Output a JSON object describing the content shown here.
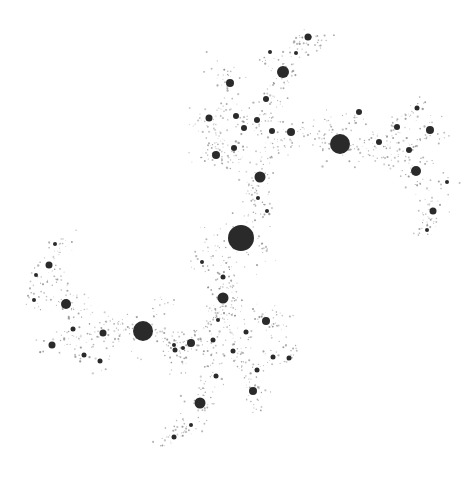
{
  "image": {
    "title": "Julia set fractal (dendrite of discs)",
    "width": 476,
    "height": 481,
    "background": "#ffffff",
    "ink": "#2a2a2a",
    "dust": "#8a8a8a"
  },
  "discs": [
    {
      "x": 241,
      "y": 238,
      "r": 13
    },
    {
      "x": 340,
      "y": 144,
      "r": 10
    },
    {
      "x": 143,
      "y": 331,
      "r": 10
    },
    {
      "x": 283,
      "y": 72,
      "r": 6
    },
    {
      "x": 260,
      "y": 177,
      "r": 5.5
    },
    {
      "x": 223,
      "y": 298,
      "r": 5.5
    },
    {
      "x": 200,
      "y": 403,
      "r": 5.5
    },
    {
      "x": 416,
      "y": 171,
      "r": 5
    },
    {
      "x": 66,
      "y": 304,
      "r": 5
    },
    {
      "x": 230,
      "y": 83,
      "r": 4
    },
    {
      "x": 216,
      "y": 155,
      "r": 4
    },
    {
      "x": 291,
      "y": 132,
      "r": 4
    },
    {
      "x": 191,
      "y": 343,
      "r": 4
    },
    {
      "x": 266,
      "y": 321,
      "r": 4
    },
    {
      "x": 253,
      "y": 391,
      "r": 4
    },
    {
      "x": 430,
      "y": 130,
      "r": 4
    },
    {
      "x": 433,
      "y": 211,
      "r": 3.5
    },
    {
      "x": 49,
      "y": 265,
      "r": 3.5
    },
    {
      "x": 52,
      "y": 345,
      "r": 3.5
    },
    {
      "x": 103,
      "y": 333,
      "r": 3.5
    },
    {
      "x": 308,
      "y": 37,
      "r": 3.5
    },
    {
      "x": 209,
      "y": 118,
      "r": 3.5
    },
    {
      "x": 257,
      "y": 120,
      "r": 3
    },
    {
      "x": 266,
      "y": 99,
      "r": 3
    },
    {
      "x": 236,
      "y": 116,
      "r": 3
    },
    {
      "x": 272,
      "y": 131,
      "r": 3
    },
    {
      "x": 234,
      "y": 148,
      "r": 3
    },
    {
      "x": 244,
      "y": 128,
      "r": 3
    },
    {
      "x": 359,
      "y": 112,
      "r": 3
    },
    {
      "x": 379,
      "y": 142,
      "r": 3
    },
    {
      "x": 409,
      "y": 150,
      "r": 3
    },
    {
      "x": 397,
      "y": 127,
      "r": 3
    },
    {
      "x": 417,
      "y": 108,
      "r": 2.5
    },
    {
      "x": 175,
      "y": 350,
      "r": 2.5
    },
    {
      "x": 213,
      "y": 340,
      "r": 2.5
    },
    {
      "x": 233,
      "y": 351,
      "r": 2.5
    },
    {
      "x": 246,
      "y": 332,
      "r": 2.5
    },
    {
      "x": 257,
      "y": 370,
      "r": 2.5
    },
    {
      "x": 216,
      "y": 376,
      "r": 2.5
    },
    {
      "x": 273,
      "y": 357,
      "r": 2.5
    },
    {
      "x": 289,
      "y": 358,
      "r": 2.5
    },
    {
      "x": 223,
      "y": 277,
      "r": 2.5
    },
    {
      "x": 73,
      "y": 329,
      "r": 2.5
    },
    {
      "x": 84,
      "y": 355,
      "r": 2.5
    },
    {
      "x": 100,
      "y": 361,
      "r": 2.5
    },
    {
      "x": 174,
      "y": 437,
      "r": 2.5
    },
    {
      "x": 191,
      "y": 425,
      "r": 2
    },
    {
      "x": 55,
      "y": 244,
      "r": 2
    },
    {
      "x": 36,
      "y": 275,
      "r": 2
    },
    {
      "x": 34,
      "y": 300,
      "r": 2
    },
    {
      "x": 183,
      "y": 348,
      "r": 2
    },
    {
      "x": 174,
      "y": 345,
      "r": 2
    },
    {
      "x": 218,
      "y": 320,
      "r": 2
    },
    {
      "x": 267,
      "y": 211,
      "r": 2
    },
    {
      "x": 258,
      "y": 198,
      "r": 2
    },
    {
      "x": 202,
      "y": 262,
      "r": 2
    },
    {
      "x": 427,
      "y": 230,
      "r": 2
    },
    {
      "x": 447,
      "y": 182,
      "r": 2
    },
    {
      "x": 270,
      "y": 52,
      "r": 2
    },
    {
      "x": 296,
      "y": 53,
      "r": 2
    }
  ],
  "branches": [
    [
      [
        241,
        238
      ],
      [
        260,
        177
      ],
      [
        283,
        72
      ],
      [
        308,
        37
      ],
      [
        330,
        40
      ]
    ],
    [
      [
        260,
        177
      ],
      [
        216,
        155
      ],
      [
        190,
        160
      ]
    ],
    [
      [
        260,
        177
      ],
      [
        291,
        132
      ],
      [
        340,
        144
      ],
      [
        379,
        142
      ],
      [
        409,
        150
      ],
      [
        440,
        130
      ]
    ],
    [
      [
        340,
        144
      ],
      [
        416,
        171
      ],
      [
        433,
        211
      ],
      [
        420,
        240
      ]
    ],
    [
      [
        409,
        150
      ],
      [
        397,
        127
      ],
      [
        417,
        108
      ]
    ],
    [
      [
        241,
        238
      ],
      [
        223,
        298
      ],
      [
        266,
        321
      ],
      [
        290,
        358
      ]
    ],
    [
      [
        223,
        298
      ],
      [
        191,
        343
      ],
      [
        143,
        331
      ],
      [
        103,
        333
      ],
      [
        52,
        345
      ]
    ],
    [
      [
        223,
        298
      ],
      [
        253,
        391
      ],
      [
        260,
        420
      ]
    ],
    [
      [
        223,
        298
      ],
      [
        200,
        403
      ],
      [
        174,
        437
      ],
      [
        150,
        440
      ]
    ],
    [
      [
        143,
        331
      ],
      [
        66,
        304
      ],
      [
        49,
        265
      ],
      [
        70,
        235
      ]
    ],
    [
      [
        66,
        304
      ],
      [
        34,
        300
      ]
    ],
    [
      [
        216,
        155
      ],
      [
        230,
        83
      ],
      [
        210,
        60
      ]
    ],
    [
      [
        216,
        155
      ],
      [
        209,
        118
      ],
      [
        190,
        120
      ]
    ],
    [
      [
        241,
        238
      ],
      [
        210,
        250
      ],
      [
        200,
        275
      ]
    ],
    [
      [
        241,
        238
      ],
      [
        270,
        255
      ]
    ],
    [
      [
        340,
        144
      ],
      [
        320,
        115
      ]
    ],
    [
      [
        143,
        331
      ],
      [
        170,
        300
      ]
    ],
    [
      [
        191,
        343
      ],
      [
        175,
        375
      ]
    ],
    [
      [
        266,
        321
      ],
      [
        290,
        320
      ]
    ]
  ]
}
